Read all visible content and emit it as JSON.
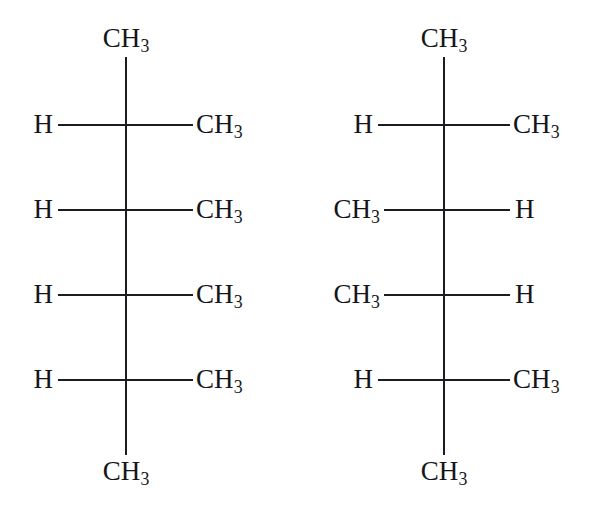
{
  "figure": {
    "background_color": "#ffffff",
    "bond_color": "#1b1b20",
    "text_color": "#151519"
  },
  "groups": {
    "methyl": "CH",
    "methyl_sub": "3",
    "hydrogen": "H"
  },
  "structures": [
    {
      "id": "left-structure",
      "name": "fischer-projection-left",
      "backbone_x": 126,
      "top_label": {
        "text": "CH",
        "sub": "3"
      },
      "bottom_label": {
        "text": "CH",
        "sub": "3"
      },
      "rows": [
        {
          "y": 125,
          "left": {
            "text": "H",
            "sub": ""
          },
          "right": {
            "text": "CH",
            "sub": "3"
          }
        },
        {
          "y": 210,
          "left": {
            "text": "H",
            "sub": ""
          },
          "right": {
            "text": "CH",
            "sub": "3"
          }
        },
        {
          "y": 295,
          "left": {
            "text": "H",
            "sub": ""
          },
          "right": {
            "text": "CH",
            "sub": "3"
          }
        },
        {
          "y": 380,
          "left": {
            "text": "H",
            "sub": ""
          },
          "right": {
            "text": "CH",
            "sub": "3"
          }
        }
      ]
    },
    {
      "id": "right-structure",
      "name": "fischer-projection-right",
      "backbone_x": 444,
      "top_label": {
        "text": "CH",
        "sub": "3"
      },
      "bottom_label": {
        "text": "CH",
        "sub": "3"
      },
      "rows": [
        {
          "y": 125,
          "left": {
            "text": "H",
            "sub": ""
          },
          "right": {
            "text": "CH",
            "sub": "3"
          }
        },
        {
          "y": 210,
          "left": {
            "text": "CH",
            "sub": "3"
          },
          "right": {
            "text": "H",
            "sub": ""
          }
        },
        {
          "y": 295,
          "left": {
            "text": "CH",
            "sub": "3"
          },
          "right": {
            "text": "H",
            "sub": ""
          }
        },
        {
          "y": 380,
          "left": {
            "text": "H",
            "sub": ""
          },
          "right": {
            "text": "CH",
            "sub": "3"
          }
        }
      ]
    }
  ],
  "labels": {
    "s1_top": "CH",
    "s1_top_sub": "3",
    "s1_bottom": "CH",
    "s1_bottom_sub": "3",
    "s1_r1_left": "H",
    "s1_r1_right": "CH",
    "s1_r1_right_sub": "3",
    "s1_r2_left": "H",
    "s1_r2_right": "CH",
    "s1_r2_right_sub": "3",
    "s1_r3_left": "H",
    "s1_r3_right": "CH",
    "s1_r3_right_sub": "3",
    "s1_r4_left": "H",
    "s1_r4_right": "CH",
    "s1_r4_right_sub": "3",
    "s2_top": "CH",
    "s2_top_sub": "3",
    "s2_bottom": "CH",
    "s2_bottom_sub": "3",
    "s2_r1_left": "H",
    "s2_r1_right": "CH",
    "s2_r1_right_sub": "3",
    "s2_r2_left": "CH",
    "s2_r2_left_sub": "3",
    "s2_r2_right": "H",
    "s2_r3_left": "CH",
    "s2_r3_left_sub": "3",
    "s2_r3_right": "H",
    "s2_r4_left": "H",
    "s2_r4_right": "CH",
    "s2_r4_right_sub": "3"
  }
}
